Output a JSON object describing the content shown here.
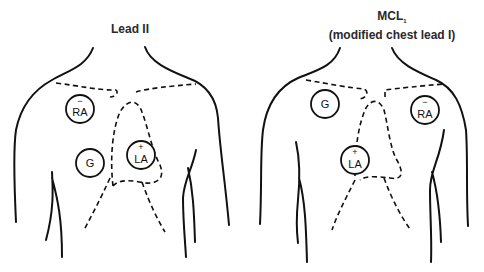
{
  "panels": [
    {
      "title": "Lead II",
      "electrodes": [
        {
          "label": "RA",
          "polarity": "−",
          "position": "right upper chest"
        },
        {
          "label": "G",
          "polarity": "",
          "position": "lower right chest"
        },
        {
          "label": "LA",
          "polarity": "+",
          "position": "left lower chest (apex)"
        }
      ]
    },
    {
      "title_main": "MCL",
      "title_subscript": "1",
      "title_sub": "(modified chest lead I)",
      "electrodes": [
        {
          "label": "G",
          "polarity": "",
          "position": "right upper chest"
        },
        {
          "label": "RA",
          "polarity": "−",
          "position": "left upper chest"
        },
        {
          "label": "LA",
          "polarity": "+",
          "position": "right sternal border"
        }
      ]
    }
  ]
}
